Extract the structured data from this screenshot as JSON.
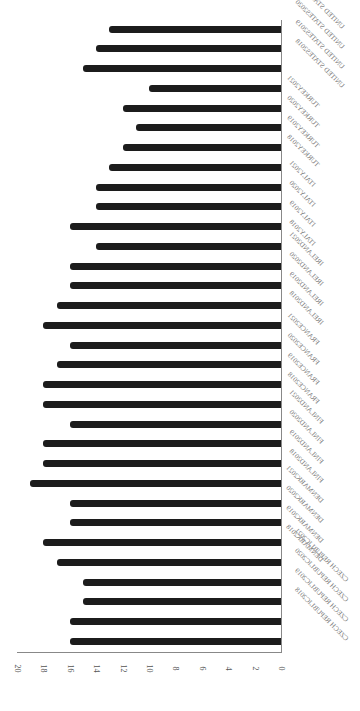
{
  "chart_data": {
    "type": "bar",
    "orientation": "horizontal (figure rotated 90°)",
    "title": "",
    "xlabel": "",
    "ylabel": "",
    "ylim": [
      0,
      20
    ],
    "ticks": [
      0,
      2,
      4,
      6,
      8,
      10,
      12,
      14,
      16,
      18,
      20
    ],
    "grid": false,
    "legend": null,
    "bar_color": "#1c1c1c",
    "categories": [
      "CZECH REPUBLIC2018",
      "CZECH REPUBLIC2019",
      "CZECH REPUBLIC2020",
      "CZECH REPUBLIC2021",
      "DENMARK2018",
      "DENMARK2019",
      "DENMARK2020",
      "DENMARK2021",
      "FINLAND2018",
      "FINLAND2019",
      "FINLAND2020",
      "FINLAND2021",
      "FRANCE2018",
      "FRANCE2019",
      "FRANCE2020",
      "FRANCE2021",
      "IRELAND2018",
      "IRELAND2019",
      "IRELAND2020",
      "IRELAND2021",
      "ITALY2018",
      "ITALY2019",
      "ITALY2020",
      "ITALY2021",
      "TURKEY2018",
      "TURKEY2019",
      "TURKEY2020",
      "TURKEY2021",
      "UNITED STATES2018",
      "UNITED STATES2019",
      "UNITED STATES2020",
      "UNITED STATES2021"
    ],
    "values": [
      16,
      16,
      15,
      15,
      17,
      18,
      16,
      16,
      19,
      18,
      18,
      16,
      18,
      18,
      17,
      16,
      18,
      17,
      16,
      16,
      14,
      16,
      14,
      14,
      13,
      12,
      11,
      12,
      10,
      15,
      14,
      13
    ]
  }
}
